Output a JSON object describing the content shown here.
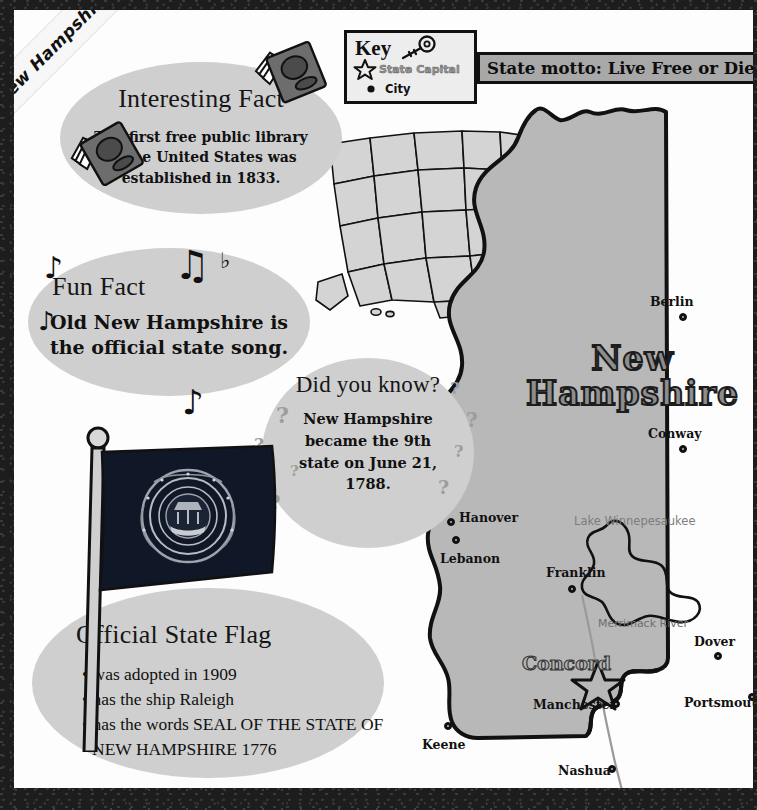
{
  "poster": {
    "ribbon_label": "New Hampshire",
    "background_color": "#1c1b1b",
    "page_color": "#fdfdfd",
    "bubble_color": "#cfcfcf"
  },
  "key_box": {
    "title": "Key",
    "key_icon": "key-icon",
    "capital_symbol": "star-icon",
    "capital_label": "State Capital",
    "city_symbol": "dot-icon",
    "city_label": "City"
  },
  "motto": {
    "text": "State motto: Live Free or Die",
    "banner_color": "#a8a8a8"
  },
  "interesting_fact": {
    "title": "Interesting Fact",
    "body": "The first free public library in the United States was established in 1833.",
    "icon": "book-icon"
  },
  "fun_fact": {
    "title": "Fun Fact",
    "body": "Old New Hampshire is the official state song.",
    "icon": "music-note-icon"
  },
  "did_you_know": {
    "title": "Did you know?",
    "body": "New Hampshire became the 9th state on June 21, 1788.",
    "icon": "question-mark-icon"
  },
  "flag_facts": {
    "title": "Official State Flag",
    "items": [
      "was adopted in 1909",
      "has the ship Raleigh",
      "has the words SEAL OF THE STATE OF NEW HAMPSHIRE 1776"
    ]
  },
  "state_map": {
    "state_name_line1": "New",
    "state_name_line2": "Hampshire",
    "capital": {
      "name": "Concord",
      "symbol": "star-icon"
    },
    "lake_label": "Lake Winnepesaukee",
    "river_label": "Merrimack River",
    "cities": [
      {
        "name": "Berlin",
        "label_x": 650,
        "label_y": 294,
        "dot_x": 679,
        "dot_y": 313
      },
      {
        "name": "Conway",
        "label_x": 648,
        "label_y": 426,
        "dot_x": 679,
        "dot_y": 445
      },
      {
        "name": "Hanover",
        "label_x": 459,
        "label_y": 510,
        "dot_x": 447,
        "dot_y": 518
      },
      {
        "name": "Lebanon",
        "label_x": 440,
        "label_y": 551,
        "dot_x": 452,
        "dot_y": 536
      },
      {
        "name": "Franklin",
        "label_x": 546,
        "label_y": 565,
        "dot_x": 568,
        "dot_y": 585
      },
      {
        "name": "Dover",
        "label_x": 694,
        "label_y": 634,
        "dot_x": 714,
        "dot_y": 652
      },
      {
        "name": "Manchester",
        "label_x": 533,
        "label_y": 697,
        "dot_x": 612,
        "dot_y": 700
      },
      {
        "name": "Portsmouth",
        "label_x": 684,
        "label_y": 695,
        "dot_x": 748,
        "dot_y": 693
      },
      {
        "name": "Keene",
        "label_x": 422,
        "label_y": 737,
        "dot_x": 444,
        "dot_y": 722
      },
      {
        "name": "Nashua",
        "label_x": 558,
        "label_y": 763,
        "dot_x": 608,
        "dot_y": 765
      }
    ]
  },
  "usa_inset": {
    "highlight": "New Hampshire"
  }
}
